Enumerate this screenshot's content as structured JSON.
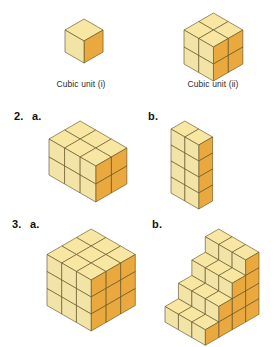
{
  "page": {
    "background": "#ffffff"
  },
  "palette": {
    "top_face": "#F7E7A3",
    "left_face": "#F2E3A6",
    "right_face": "#E9A93E",
    "edge": "#5A4A1E",
    "outline": "#1A1A1A",
    "text": "#1a1a1a",
    "caption_text": "#2b2b2b"
  },
  "captions": {
    "unit_i": "Cubic unit (i)",
    "unit_ii": "Cubic unit (ii)"
  },
  "labels": {
    "q2_number": "2.",
    "q2_a": "a.",
    "q2_b": "b.",
    "q3_number": "3.",
    "q3_a": "a.",
    "q3_b": "b."
  },
  "figures": {
    "unit_i": {
      "name": "unit-cube",
      "dims": {
        "w": 1,
        "d": 1,
        "h": 1
      },
      "cube_size": 22
    },
    "unit_ii": {
      "name": "two-by-two-by-two-cube",
      "dims": {
        "w": 2,
        "d": 2,
        "h": 2
      },
      "cube_size": 17
    },
    "q2a": {
      "name": "rectangular-prism-3x2x2",
      "dims": {
        "w": 3,
        "d": 2,
        "h": 2
      },
      "cube_size": 18
    },
    "q2b": {
      "name": "tower-prism-2x1x4",
      "dims": {
        "w": 2,
        "d": 1,
        "h": 4
      },
      "cube_size": 16
    },
    "q3a": {
      "name": "cube-3x3x3",
      "dims": {
        "w": 3,
        "d": 3,
        "h": 3
      },
      "cube_size": 17
    },
    "q3b": {
      "name": "staircase-solid",
      "cube_size": 15.5,
      "steps": [
        4,
        3,
        2,
        1
      ],
      "width": 3
    }
  }
}
